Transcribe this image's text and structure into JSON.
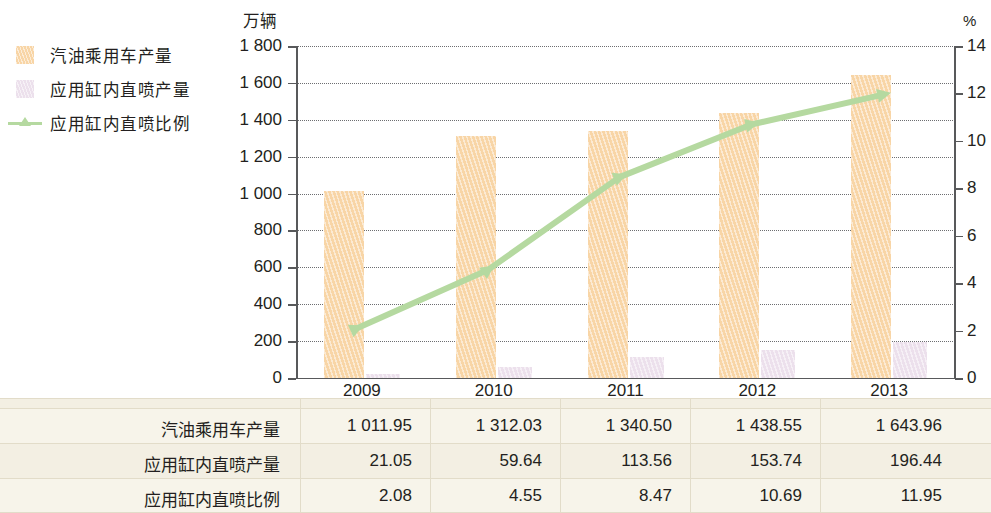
{
  "legend": {
    "items": [
      {
        "label": "汽油乘用车产量",
        "marker": "bar-swatch-orange",
        "color": "#f8d5a6"
      },
      {
        "label": "应用缸内直喷产量",
        "marker": "bar-swatch-pink",
        "color": "#ece0ec"
      },
      {
        "label": "应用缸内直喷比例",
        "marker": "line-swatch-green",
        "color": "#b5d9a0"
      }
    ]
  },
  "axes": {
    "left_title": "万辆",
    "right_title": "%",
    "left_ticks": [
      "1 800",
      "1 600",
      "1 400",
      "1 200",
      "1 000",
      "800",
      "600",
      "400",
      "200",
      "0"
    ],
    "right_ticks": [
      "14",
      "12",
      "10",
      "8",
      "6",
      "4",
      "2",
      "0"
    ]
  },
  "table": {
    "header": [
      "",
      "2009",
      "2010",
      "2011",
      "2012",
      "2013"
    ],
    "rows": [
      {
        "label": "汽油乘用车产量",
        "values": [
          "1 011.95",
          "1 312.03",
          "1 340.50",
          "1 438.55",
          "1 643.96"
        ]
      },
      {
        "label": "应用缸内直喷产量",
        "values": [
          "21.05",
          "59.64",
          "113.56",
          "153.74",
          "196.44"
        ]
      },
      {
        "label": "应用缸内直喷比例",
        "values": [
          "2.08",
          "4.55",
          "8.47",
          "10.69",
          "11.95"
        ]
      }
    ]
  },
  "chart_data": {
    "type": "bar",
    "title": "",
    "xlabel": "",
    "ylabel": "万辆",
    "y2label": "%",
    "categories": [
      "2009",
      "2010",
      "2011",
      "2012",
      "2013"
    ],
    "ylim": [
      0,
      1800
    ],
    "y2lim": [
      0,
      14
    ],
    "yticks": [
      0,
      200,
      400,
      600,
      800,
      1000,
      1200,
      1400,
      1600,
      1800
    ],
    "y2ticks": [
      0,
      2,
      4,
      6,
      8,
      10,
      12,
      14
    ],
    "grid": true,
    "legend_position": "top-left-outside",
    "series": [
      {
        "name": "汽油乘用车产量",
        "type": "bar",
        "axis": "left",
        "color": "#f8d5a6",
        "values": [
          1011.95,
          1312.03,
          1340.5,
          1438.55,
          1643.96
        ]
      },
      {
        "name": "应用缸内直喷产量",
        "type": "bar",
        "axis": "left",
        "color": "#ece0ec",
        "values": [
          21.05,
          59.64,
          113.56,
          153.74,
          196.44
        ]
      },
      {
        "name": "应用缸内直喷比例",
        "type": "line",
        "axis": "right",
        "color": "#b5d9a0",
        "values": [
          2.08,
          4.55,
          8.47,
          10.69,
          11.95
        ]
      }
    ]
  }
}
